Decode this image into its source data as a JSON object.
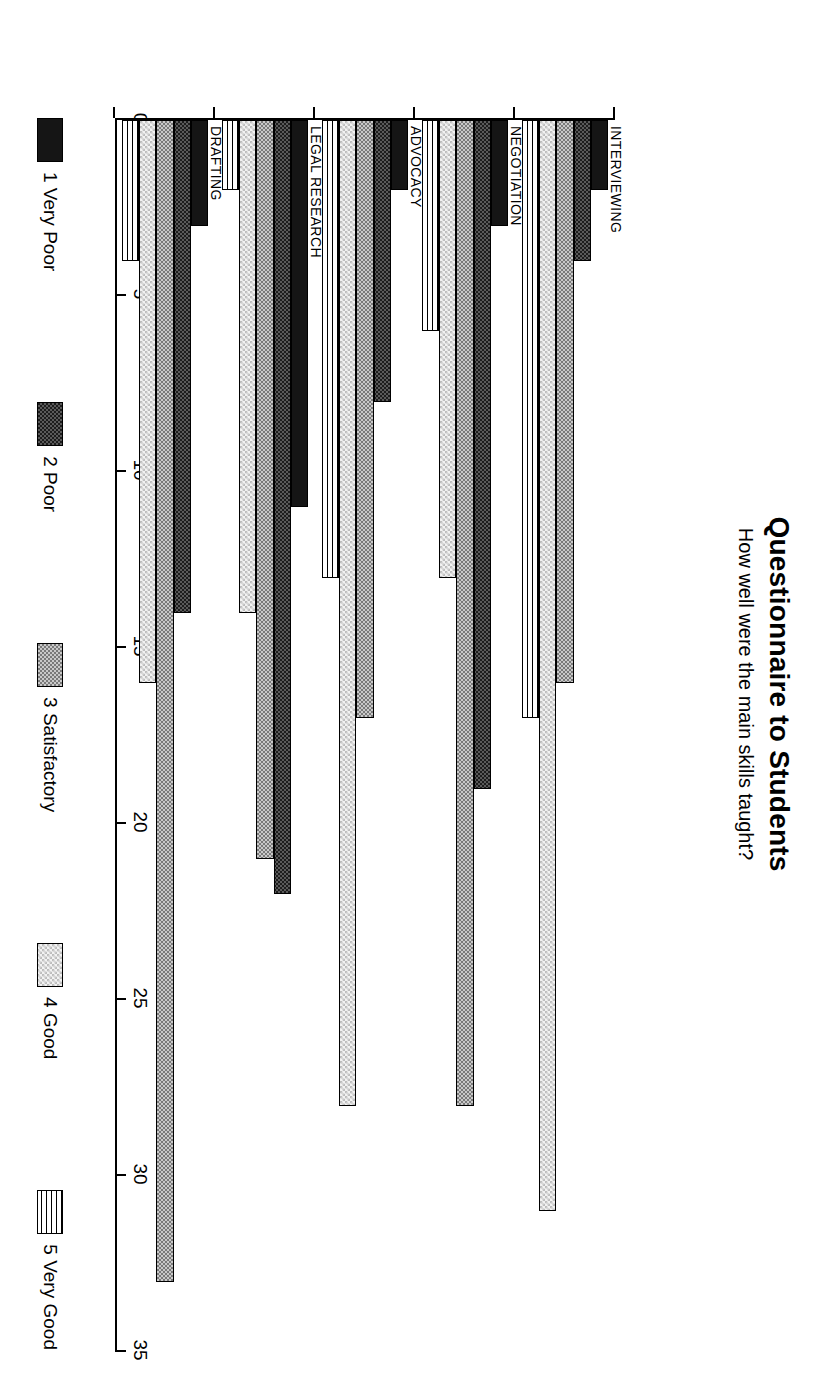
{
  "header": {
    "title": "Questionnaire to Students",
    "subtitle": "How well were the main skills taught?"
  },
  "chart_data": {
    "type": "bar",
    "orientation": "horizontal",
    "title": "Questionnaire to Students",
    "subtitle": "How well were the main skills taught?",
    "xlabel": "",
    "ylabel": "",
    "xlim": [
      0,
      35
    ],
    "xticks": [
      0,
      5,
      10,
      15,
      20,
      25,
      30,
      35
    ],
    "xtick_labels": [
      "0",
      "5",
      "10",
      "15",
      "20",
      "25",
      "30",
      "35"
    ],
    "grid": false,
    "legend_position": "bottom",
    "categories": [
      "INTERVIEWING",
      "NEGOTIATION",
      "ADVOCACY",
      "LEGAL RESEARCH",
      "DRAFTING"
    ],
    "series": [
      {
        "name": "1 Very Poor",
        "fill": "solid-black",
        "values": [
          2,
          3,
          2,
          11,
          3
        ]
      },
      {
        "name": "2 Poor",
        "fill": "dark-checker",
        "values": [
          4,
          19,
          8,
          22,
          14
        ]
      },
      {
        "name": "3 Satisfactory",
        "fill": "medium-checker",
        "values": [
          16,
          28,
          17,
          21,
          33
        ]
      },
      {
        "name": "4 Good",
        "fill": "light-stipple",
        "values": [
          31,
          13,
          28,
          14,
          16
        ]
      },
      {
        "name": "5 Very Good",
        "fill": "horizontal-rules",
        "values": [
          17,
          6,
          13,
          2,
          4
        ]
      }
    ]
  },
  "legend": {
    "items": [
      {
        "label": "1 Very Poor"
      },
      {
        "label": "2 Poor"
      },
      {
        "label": "3 Satisfactory"
      },
      {
        "label": "4 Good"
      },
      {
        "label": "5 Very Good"
      }
    ]
  }
}
